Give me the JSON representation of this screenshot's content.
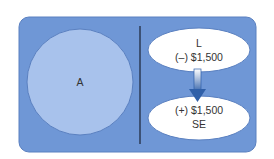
{
  "diagram": {
    "left": {
      "label": "A"
    },
    "right": {
      "top_ellipse": {
        "line1": "L",
        "line2": "(–) $1,500"
      },
      "bottom_ellipse": {
        "line1": "(+) $1,500",
        "line2": "SE"
      }
    },
    "colors": {
      "panel": "#6f97d6",
      "circle": "#a8c2ec",
      "ellipse": "#ffffff",
      "arrow": "#2f5fa8",
      "divider": "#2b3a55"
    }
  }
}
